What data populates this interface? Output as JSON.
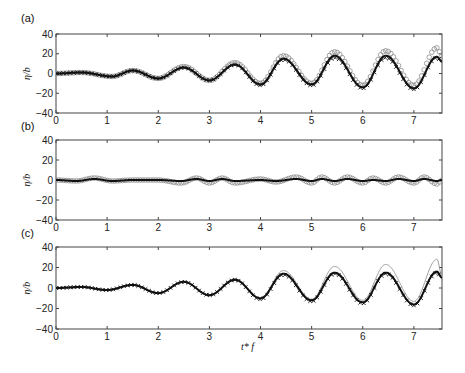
{
  "figure": {
    "xlabel": "t* f",
    "ylabel": "η/b",
    "panels": [
      "(a)",
      "(b)",
      "(c)"
    ]
  },
  "chart_data": [
    {
      "type": "line",
      "panel": "(a)",
      "xlabel": "",
      "ylabel": "η/b",
      "xlim": [
        0,
        7.55
      ],
      "ylim": [
        -40,
        40
      ],
      "xticks": [
        0,
        1,
        2,
        3,
        4,
        5,
        6,
        7
      ],
      "yticks": [
        40,
        20,
        0,
        -20,
        -40
      ],
      "grid": false,
      "series": [
        {
          "name": "line",
          "style": "solid-black",
          "extrema_t": [
            0,
            0.5,
            1.1,
            1.5,
            2.0,
            2.5,
            3.0,
            3.5,
            4.0,
            4.45,
            5.0,
            5.45,
            6.0,
            6.45,
            7.0,
            7.45,
            7.55
          ],
          "extrema_v": [
            0,
            1,
            -3,
            3,
            -5,
            6,
            -7,
            9,
            -11,
            15,
            -11,
            18,
            -14,
            18,
            -15,
            17,
            12
          ]
        },
        {
          "name": "circles",
          "style": "open-circle-gray",
          "extrema_t": [
            0,
            0.5,
            1.1,
            1.5,
            2.0,
            2.5,
            3.0,
            3.5,
            4.0,
            4.45,
            5.0,
            5.45,
            6.0,
            6.45,
            7.0,
            7.45,
            7.55
          ],
          "extrema_v": [
            0,
            1,
            -3,
            3,
            -5,
            7,
            -7,
            11,
            -10,
            18,
            -10,
            22,
            -12,
            23,
            -12,
            26,
            18
          ]
        },
        {
          "name": "crosses",
          "style": "x-marker-black",
          "extrema_t": [
            0,
            0.5,
            1.1,
            1.5,
            2.0,
            2.5,
            3.0,
            3.5,
            4.0,
            4.45,
            5.0,
            5.45,
            6.0,
            6.45,
            7.0,
            7.45,
            7.55
          ],
          "extrema_v": [
            0,
            1,
            -3,
            3,
            -5,
            6,
            -7,
            9,
            -12,
            14,
            -12,
            16,
            -15,
            16,
            -16,
            16,
            12
          ]
        }
      ]
    },
    {
      "type": "line",
      "panel": "(b)",
      "xlabel": "",
      "ylabel": "η/b",
      "xlim": [
        0,
        7.55
      ],
      "ylim": [
        -40,
        40
      ],
      "xticks": [
        0,
        1,
        2,
        3,
        4,
        5,
        6,
        7
      ],
      "yticks": [
        40,
        20,
        0,
        -20,
        -40
      ],
      "grid": false,
      "series": [
        {
          "name": "line",
          "style": "solid-black",
          "extrema_t": [
            0,
            0.4,
            0.75,
            1.1,
            1.5,
            2.0,
            2.45,
            2.75,
            3.0,
            3.25,
            3.5,
            4.0,
            4.3,
            4.7,
            5.0,
            5.2,
            5.45,
            5.7,
            6.0,
            6.2,
            6.45,
            6.7,
            7.0,
            7.2,
            7.45,
            7.55
          ],
          "extrema_v": [
            0,
            -1,
            1,
            -1,
            0,
            0,
            -1,
            1,
            -1,
            1,
            -1,
            0,
            -1,
            1,
            -1,
            1,
            -1,
            1,
            -1,
            0,
            -1,
            1,
            -1,
            1,
            -1,
            0
          ]
        },
        {
          "name": "circles",
          "style": "open-circle-gray",
          "extrema_t": [
            0,
            0.4,
            0.75,
            1.1,
            1.5,
            2.0,
            2.45,
            2.75,
            3.0,
            3.25,
            3.5,
            4.0,
            4.3,
            4.7,
            5.0,
            5.2,
            5.45,
            5.7,
            6.0,
            6.2,
            6.45,
            6.7,
            7.0,
            7.2,
            7.45,
            7.55
          ],
          "extrema_v": [
            0,
            -1,
            2,
            -1,
            0,
            0,
            -3,
            2,
            -3,
            2,
            -3,
            1,
            -2,
            3,
            -3,
            3,
            -3,
            3,
            -3,
            2,
            -3,
            3,
            -3,
            3,
            -4,
            0
          ]
        }
      ]
    },
    {
      "type": "line",
      "panel": "(c)",
      "xlabel": "t* f",
      "ylabel": "η/b",
      "xlim": [
        0,
        7.55
      ],
      "ylim": [
        -40,
        40
      ],
      "xticks": [
        0,
        1,
        2,
        3,
        4,
        5,
        6,
        7
      ],
      "yticks": [
        40,
        20,
        0,
        -20,
        -40
      ],
      "grid": false,
      "series": [
        {
          "name": "line",
          "style": "solid-black",
          "extrema_t": [
            0,
            0.5,
            1.0,
            1.5,
            2.0,
            2.5,
            3.0,
            3.5,
            4.0,
            4.45,
            5.0,
            5.45,
            6.0,
            6.45,
            7.0,
            7.45,
            7.55
          ],
          "extrema_v": [
            0,
            1,
            -2,
            3,
            -5,
            6,
            -7,
            8,
            -10,
            14,
            -12,
            15,
            -14,
            15,
            -16,
            16,
            10
          ]
        },
        {
          "name": "thin-gray",
          "style": "thin-gray-line",
          "extrema_t": [
            0,
            0.5,
            1.0,
            1.5,
            2.0,
            2.5,
            3.0,
            3.5,
            4.0,
            4.45,
            5.0,
            5.45,
            6.0,
            6.45,
            7.0,
            7.45,
            7.55
          ],
          "extrema_v": [
            0,
            1,
            -2,
            3,
            -5,
            6,
            -7,
            9,
            -10,
            17,
            -11,
            21,
            -12,
            23,
            -13,
            28,
            12
          ]
        },
        {
          "name": "crosses",
          "style": "x-marker-black",
          "extrema_t": [
            0,
            0.5,
            1.0,
            1.5,
            2.0,
            2.5,
            3.0,
            3.5,
            4.0,
            4.45,
            5.0,
            5.45,
            6.0,
            6.45,
            7.0,
            7.45,
            7.55
          ],
          "extrema_v": [
            0,
            1,
            -2,
            3,
            -5,
            6,
            -7,
            8,
            -11,
            13,
            -13,
            14,
            -15,
            14,
            -17,
            15,
            10
          ]
        }
      ]
    }
  ]
}
